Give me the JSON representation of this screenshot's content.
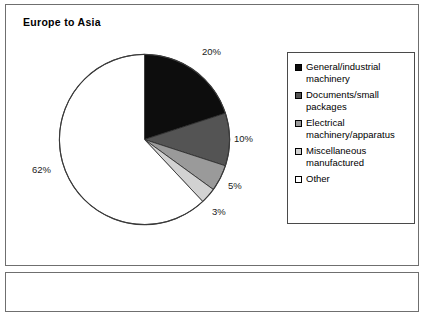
{
  "panel": {
    "title": "Europe to Asia"
  },
  "legend": {
    "items": [
      {
        "label": "General/industrial machinery",
        "color": "#0d0d0d"
      },
      {
        "label": "Documents/small packages",
        "color": "#545454"
      },
      {
        "label": "Electrical machinery/apparatus",
        "color": "#9a9a9a"
      },
      {
        "label": "Miscellaneous manufactured",
        "color": "#d2d2d2"
      },
      {
        "label": "Other",
        "color": "#ffffff"
      }
    ]
  },
  "chart_data": {
    "type": "pie",
    "title": "Europe to Asia",
    "categories": [
      "General/industrial machinery",
      "Documents/small packages",
      "Electrical machinery/apparatus",
      "Miscellaneous manufactured",
      "Other"
    ],
    "values": [
      20,
      10,
      5,
      3,
      62
    ],
    "data_labels": [
      "20%",
      "10%",
      "5%",
      "3%",
      "62%"
    ],
    "colors": [
      "#0d0d0d",
      "#545454",
      "#9a9a9a",
      "#d2d2d2",
      "#ffffff"
    ],
    "start_angle_deg": 0,
    "direction": "clockwise",
    "legend_position": "right",
    "grid": false,
    "xlabel": "",
    "ylabel": ""
  }
}
